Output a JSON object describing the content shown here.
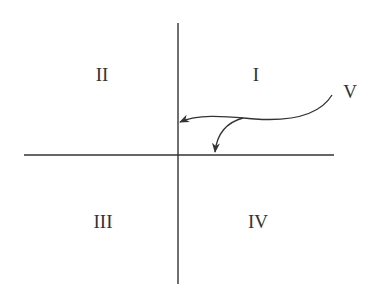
{
  "diagram": {
    "quadrants": [
      {
        "id": "I",
        "label": "I"
      },
      {
        "id": "II",
        "label": "II"
      },
      {
        "id": "III",
        "label": "III"
      },
      {
        "id": "IV",
        "label": "IV"
      }
    ],
    "curve_label": "V",
    "colors": {
      "line": "#333333",
      "background": "#ffffff"
    }
  }
}
